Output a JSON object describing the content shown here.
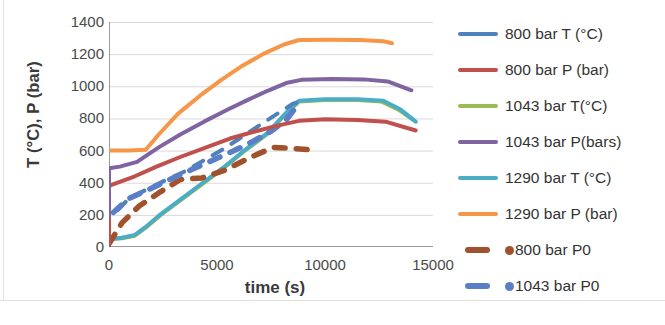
{
  "chart_data": {
    "type": "line",
    "title": "",
    "xlabel": "time (s)",
    "ylabel": "T (°C), P (bar)",
    "xlim": [
      0,
      15000
    ],
    "ylim": [
      0,
      1400
    ],
    "xticks": [
      "0",
      "5000",
      "10000",
      "15000"
    ],
    "yticks": [
      "0",
      "200",
      "400",
      "600",
      "800",
      "1000",
      "1200",
      "1400"
    ],
    "grid": "horizontal",
    "legend_position": "right",
    "series": [
      {
        "name": "800 bar T (°C)",
        "color": "#4F81BD",
        "style": "dashed",
        "points": [
          [
            0,
            0
          ],
          [
            0,
            210
          ],
          [
            300,
            215
          ],
          [
            900,
            300
          ],
          [
            1700,
            355
          ],
          [
            2600,
            415
          ],
          [
            3500,
            470
          ],
          [
            4400,
            540
          ],
          [
            5300,
            610
          ],
          [
            6100,
            680
          ],
          [
            7000,
            760
          ],
          [
            7800,
            830
          ],
          [
            8500,
            890
          ],
          [
            9000,
            915
          ]
        ]
      },
      {
        "name": "800 bar P (bar)",
        "color": "#C0504D",
        "style": "solid",
        "points": [
          [
            0,
            20
          ],
          [
            0,
            380
          ],
          [
            400,
            400
          ],
          [
            1200,
            440
          ],
          [
            2200,
            500
          ],
          [
            3300,
            560
          ],
          [
            4500,
            620
          ],
          [
            5600,
            675
          ],
          [
            6800,
            720
          ],
          [
            7800,
            755
          ],
          [
            8800,
            785
          ],
          [
            10000,
            795
          ],
          [
            11500,
            790
          ],
          [
            12800,
            780
          ],
          [
            14200,
            725
          ]
        ]
      },
      {
        "name": "1043 bar T(°C)",
        "color": "#9BBB59",
        "style": "solid",
        "points": [
          [
            0,
            48
          ],
          [
            600,
            55
          ],
          [
            1200,
            70
          ],
          [
            1700,
            120
          ],
          [
            2400,
            200
          ],
          [
            3300,
            290
          ],
          [
            4300,
            390
          ],
          [
            5300,
            490
          ],
          [
            6300,
            600
          ],
          [
            7300,
            700
          ],
          [
            8200,
            830
          ],
          [
            8800,
            905
          ],
          [
            10000,
            915
          ],
          [
            11500,
            915
          ],
          [
            12600,
            905
          ],
          [
            13400,
            855
          ],
          [
            14100,
            790
          ]
        ]
      },
      {
        "name": "1043 bar P(bars)",
        "color": "#8064A2",
        "style": "solid",
        "points": [
          [
            0,
            190
          ],
          [
            0,
            490
          ],
          [
            500,
            500
          ],
          [
            1300,
            530
          ],
          [
            2300,
            620
          ],
          [
            3300,
            700
          ],
          [
            4400,
            780
          ],
          [
            5500,
            855
          ],
          [
            6500,
            920
          ],
          [
            7400,
            975
          ],
          [
            8200,
            1020
          ],
          [
            8900,
            1040
          ],
          [
            10300,
            1045
          ],
          [
            11800,
            1043
          ],
          [
            12900,
            1030
          ],
          [
            14000,
            975
          ]
        ]
      },
      {
        "name": "1290 bar T (°C)",
        "color": "#4BACC6",
        "style": "solid",
        "points": [
          [
            0,
            48
          ],
          [
            600,
            58
          ],
          [
            1200,
            75
          ],
          [
            1700,
            125
          ],
          [
            2400,
            205
          ],
          [
            3300,
            295
          ],
          [
            4300,
            395
          ],
          [
            5300,
            495
          ],
          [
            6300,
            605
          ],
          [
            7300,
            705
          ],
          [
            8200,
            835
          ],
          [
            8800,
            910
          ],
          [
            10000,
            920
          ],
          [
            11500,
            920
          ],
          [
            12700,
            910
          ],
          [
            13500,
            855
          ],
          [
            14200,
            780
          ]
        ]
      },
      {
        "name": "1290 bar P (bar)",
        "color": "#F79646",
        "style": "solid",
        "points": [
          [
            0,
            600
          ],
          [
            900,
            600
          ],
          [
            1700,
            605
          ],
          [
            2300,
            700
          ],
          [
            3200,
            830
          ],
          [
            4200,
            940
          ],
          [
            5200,
            1040
          ],
          [
            6200,
            1130
          ],
          [
            7200,
            1205
          ],
          [
            8100,
            1260
          ],
          [
            8800,
            1288
          ],
          [
            10200,
            1290
          ],
          [
            11600,
            1288
          ],
          [
            12700,
            1280
          ],
          [
            13100,
            1268
          ]
        ]
      },
      {
        "name": "800 bar P0",
        "color": "#A0522D",
        "style": "dashed-marker",
        "points": [
          [
            0,
            20
          ],
          [
            600,
            150
          ],
          [
            1400,
            255
          ],
          [
            2400,
            345
          ],
          [
            3300,
            420
          ],
          [
            4300,
            430
          ],
          [
            5400,
            480
          ],
          [
            6500,
            555
          ],
          [
            7600,
            620
          ],
          [
            9400,
            605
          ]
        ]
      },
      {
        "name": "1043 bar P0",
        "color": "#5B7FC7",
        "style": "dashed-marker",
        "points": [
          [
            200,
            215
          ],
          [
            900,
            300
          ],
          [
            1800,
            355
          ],
          [
            2800,
            420
          ],
          [
            3800,
            480
          ],
          [
            4800,
            540
          ],
          [
            5800,
            600
          ],
          [
            6700,
            660
          ],
          [
            7500,
            720
          ],
          [
            8200,
            790
          ],
          [
            8600,
            860
          ]
        ]
      }
    ]
  },
  "legend": {
    "items": [
      {
        "label": "800 bar T (°C)",
        "color": "#4F81BD",
        "swatch": "line",
        "dot": false
      },
      {
        "label": "800 bar P (bar)",
        "color": "#C0504D",
        "swatch": "line",
        "dot": false
      },
      {
        "label": "1043 bar T(°C)",
        "color": "#9BBB59",
        "swatch": "line",
        "dot": false
      },
      {
        "label": "1043 bar P(bars)",
        "color": "#8064A2",
        "swatch": "line",
        "dot": false
      },
      {
        "label": "1290 bar T (°C)",
        "color": "#4BACC6",
        "swatch": "line",
        "dot": false
      },
      {
        "label": "1290 bar P (bar)",
        "color": "#F79646",
        "swatch": "line",
        "dot": false
      },
      {
        "label": "800 bar P0",
        "color": "#A0522D",
        "swatch": "short",
        "dot": true
      },
      {
        "label": "1043 bar P0",
        "color": "#5B7FC7",
        "swatch": "short",
        "dot": true
      }
    ]
  },
  "axes": {
    "x_title": "time (s)",
    "y_title": "T (°C), P (bar)"
  },
  "colors": {
    "grid": "#d9d9d9",
    "axis": "#9a9a9a",
    "text": "#3a3a3a"
  }
}
